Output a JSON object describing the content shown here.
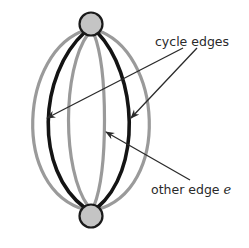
{
  "diagram": {
    "type": "multigraph-two-vertices",
    "nodes": [
      {
        "id": "top",
        "cx": 91,
        "cy": 24,
        "r": 11.5
      },
      {
        "id": "bottom",
        "cx": 91,
        "cy": 216,
        "r": 11.5
      }
    ],
    "edges": [
      {
        "id": "outer-left",
        "kind": "other",
        "bulge_x": 22
      },
      {
        "id": "cycle-left",
        "kind": "cycle",
        "bulge_x": 45
      },
      {
        "id": "inner-left",
        "kind": "other",
        "bulge_x": 69
      },
      {
        "id": "inner-right",
        "kind": "other",
        "bulge_x": 104
      },
      {
        "id": "cycle-right",
        "kind": "cycle",
        "bulge_x": 129
      },
      {
        "id": "outer-right",
        "kind": "other",
        "bulge_x": 151
      }
    ],
    "labels": {
      "cycle_edges": "cycle edges",
      "other_edge_prefix": "other edge ",
      "other_edge_var": "e"
    },
    "colors": {
      "cycle_edge": "#141414",
      "other_edge": "#9a9a9a",
      "node_fill": "#c4c4c4",
      "node_stroke": "#1a1a1a",
      "arrow": "#2a2a2a",
      "text": "#2a2a2a"
    }
  }
}
